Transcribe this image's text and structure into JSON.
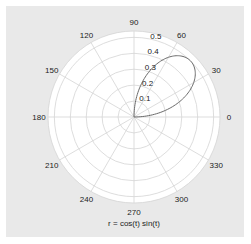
{
  "chart_data": {
    "type": "polar-line",
    "title": "r = cos(t) sin(t)",
    "function": "r = cos(t) sin(t)",
    "theta_range_deg": [
      0,
      90
    ],
    "angular_ticks": [
      "0",
      "30",
      "60",
      "90",
      "120",
      "150",
      "180",
      "210",
      "240",
      "270",
      "300",
      "330"
    ],
    "angular_tick_values_deg": [
      0,
      30,
      60,
      90,
      120,
      150,
      180,
      210,
      240,
      270,
      300,
      330
    ],
    "radial_ticks": [
      "0.1",
      "0.2",
      "0.3",
      "0.4",
      "0.5"
    ],
    "radial_tick_values": [
      0.1,
      0.2,
      0.3,
      0.4,
      0.5
    ],
    "rlim": [
      0,
      0.54
    ],
    "grid": true,
    "series": [
      {
        "name": "r = cos(t) sin(t)",
        "color": "#6a6a6a",
        "points_sampled": [
          {
            "t_deg": 0,
            "r": 0.0
          },
          {
            "t_deg": 15,
            "r": 0.25
          },
          {
            "t_deg": 30,
            "r": 0.433
          },
          {
            "t_deg": 45,
            "r": 0.5
          },
          {
            "t_deg": 60,
            "r": 0.433
          },
          {
            "t_deg": 75,
            "r": 0.25
          },
          {
            "t_deg": 90,
            "r": 0.0
          }
        ]
      }
    ]
  },
  "colors": {
    "figure_bg": "#e9e9e9",
    "axes_bg": "#ffffff",
    "grid": "#d4d4d4",
    "curve": "#6a6a6a",
    "text": "#222222"
  }
}
